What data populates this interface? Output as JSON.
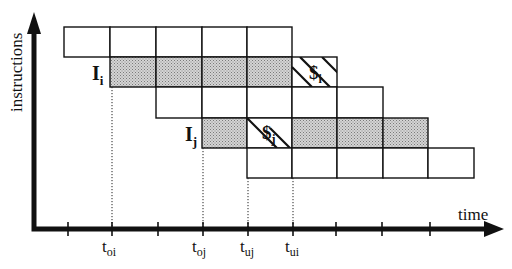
{
  "diagram": {
    "type": "pipeline-timing",
    "y_axis_label": "instructions",
    "x_axis_label": "time",
    "instruction_labels": [
      {
        "id": "Ii",
        "base": "I",
        "sub": "i",
        "row": 1
      },
      {
        "id": "Ij",
        "base": "I",
        "sub": "j",
        "row": 3
      }
    ],
    "time_markers": [
      {
        "id": "toi",
        "base": "t",
        "sub": "oi",
        "tick": 1
      },
      {
        "id": "toj",
        "base": "t",
        "sub": "oj",
        "tick": 3
      },
      {
        "id": "tuj",
        "base": "t",
        "sub": "uj",
        "tick": 4
      },
      {
        "id": "tui",
        "base": "t",
        "sub": "ui",
        "tick": 5
      }
    ],
    "tick_count": 9,
    "rows": [
      {
        "start": 0,
        "cells": [
          "empty",
          "empty",
          "empty",
          "empty",
          "empty"
        ]
      },
      {
        "start": 1,
        "cells": [
          "shaded",
          "shaded",
          "shaded",
          "shaded",
          "hatched"
        ],
        "hatched_symbol": {
          "base": "$",
          "sub": "i"
        }
      },
      {
        "start": 2,
        "cells": [
          "empty",
          "empty",
          "empty",
          "empty",
          "empty"
        ]
      },
      {
        "start": 3,
        "cells": [
          "shaded",
          "hatched",
          "shaded",
          "shaded",
          "shaded"
        ],
        "hatched_symbol": {
          "base": "$",
          "sub": "j"
        }
      },
      {
        "start": 4,
        "cells": [
          "empty",
          "empty",
          "empty",
          "empty",
          "empty"
        ]
      }
    ],
    "colors": {
      "line": "#111111",
      "shade": "#bdbdbd",
      "background": "#ffffff"
    }
  }
}
